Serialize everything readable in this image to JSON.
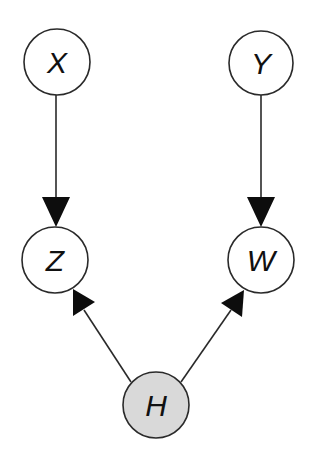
{
  "diagram": {
    "type": "directed-graph",
    "colors": {
      "background": "#ffffff",
      "stroke": "#2a2a2a",
      "node_fill": "#ffffff",
      "hidden_node_fill": "#d9d9d9",
      "label": "#111111"
    },
    "nodes": [
      {
        "id": "X",
        "label": "X",
        "cx": 57,
        "cy": 62,
        "r": 33,
        "shaded": false
      },
      {
        "id": "Y",
        "label": "Y",
        "cx": 261,
        "cy": 63,
        "r": 32,
        "shaded": false
      },
      {
        "id": "Z",
        "label": "Z",
        "cx": 55,
        "cy": 260,
        "r": 33,
        "shaded": false
      },
      {
        "id": "W",
        "label": "W",
        "cx": 261,
        "cy": 260,
        "r": 33,
        "shaded": false
      },
      {
        "id": "H",
        "label": "H",
        "cx": 156,
        "cy": 405,
        "r": 33,
        "shaded": true
      }
    ],
    "edges": [
      {
        "from": "X",
        "to": "Z"
      },
      {
        "from": "Y",
        "to": "W"
      },
      {
        "from": "H",
        "to": "Z"
      },
      {
        "from": "H",
        "to": "W"
      }
    ]
  }
}
